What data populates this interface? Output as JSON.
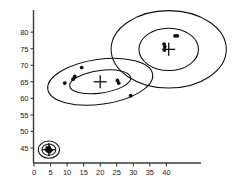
{
  "chart_data": {
    "type": "scatter",
    "title": "",
    "xlabel": "",
    "ylabel": "",
    "xlim": [
      0,
      45
    ],
    "ylim": [
      41,
      82
    ],
    "grid": false,
    "legend": false,
    "xticks": [
      0,
      5,
      10,
      15,
      20,
      25,
      30,
      35,
      40
    ],
    "yticks": [
      45,
      50,
      55,
      60,
      65,
      70,
      75,
      80
    ],
    "xtick_labels": [
      "0",
      "5",
      "10",
      "15",
      "20",
      "25",
      "30",
      "35",
      "40"
    ],
    "ytick_labels": [
      "45",
      "50",
      "55",
      "60",
      "65",
      "70",
      "75",
      "80"
    ],
    "clusters": [
      {
        "name": "cluster-low-left",
        "centroid": [
          4.5,
          44.5
        ],
        "contours": [
          {
            "rx": 3.2,
            "ry": 2.6,
            "angle": 0
          },
          {
            "rx": 2.1,
            "ry": 1.7,
            "angle": 0
          }
        ],
        "points": [
          [
            4.0,
            45.0
          ],
          [
            4.6,
            45.1
          ],
          [
            4.3,
            44.6
          ],
          [
            4.9,
            44.5
          ],
          [
            4.2,
            44.1
          ],
          [
            4.7,
            43.9
          ],
          [
            5.1,
            44.3
          ],
          [
            3.9,
            44.4
          ]
        ]
      },
      {
        "name": "cluster-middle",
        "centroid": [
          20.0,
          65.0
        ],
        "contours": [
          {
            "rx": 16.0,
            "ry": 6.8,
            "angle": -8
          },
          {
            "rx": 9.3,
            "ry": 3.4,
            "angle": -8
          }
        ],
        "points": [
          [
            9.3,
            64.6
          ],
          [
            11.8,
            65.8
          ],
          [
            12.3,
            66.6
          ],
          [
            14.4,
            69.3
          ],
          [
            25.2,
            65.4
          ],
          [
            25.6,
            64.6
          ],
          [
            29.2,
            60.8
          ]
        ]
      },
      {
        "name": "cluster-upper-right",
        "centroid": [
          40.7,
          74.8
        ],
        "contours": [
          {
            "rx": 17.4,
            "ry": 11.7,
            "angle": 0
          },
          {
            "rx": 9.0,
            "ry": 6.4,
            "angle": 0
          }
        ],
        "points": [
          [
            39.3,
            76.4
          ],
          [
            39.5,
            75.6
          ],
          [
            39.4,
            74.6
          ],
          [
            42.6,
            78.9
          ],
          [
            43.3,
            78.9
          ]
        ]
      }
    ]
  },
  "axes": {
    "x_axis_name": "x-axis",
    "y_axis_name": "y-axis"
  }
}
